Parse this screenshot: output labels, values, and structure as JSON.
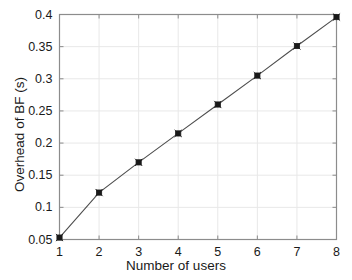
{
  "chart_data": {
    "type": "line",
    "title": "",
    "xlabel": "Number of users",
    "ylabel": "Overhead of BF (s)",
    "x": [
      1,
      2,
      3,
      4,
      5,
      6,
      7,
      8
    ],
    "values": [
      0.053,
      0.123,
      0.17,
      0.215,
      0.26,
      0.305,
      0.351,
      0.396
    ],
    "series": [
      {
        "name": "Overhead of BF",
        "values": [
          0.053,
          0.123,
          0.17,
          0.215,
          0.26,
          0.305,
          0.351,
          0.396
        ]
      }
    ],
    "xlim": [
      1,
      8
    ],
    "ylim": [
      0.05,
      0.4
    ],
    "xticks": [
      1,
      2,
      3,
      4,
      5,
      6,
      7,
      8
    ],
    "yticks": [
      0.05,
      0.1,
      0.15,
      0.2,
      0.25,
      0.3,
      0.35,
      0.4
    ],
    "xtick_labels": [
      "1",
      "2",
      "3",
      "4",
      "5",
      "6",
      "7",
      "8"
    ],
    "ytick_labels": [
      "0.05",
      "0.1",
      "0.15",
      "0.2",
      "0.25",
      "0.3",
      "0.35",
      "0.4"
    ],
    "grid": true,
    "legend": false,
    "marker": "square",
    "line_color": "#4d4d4d",
    "marker_color": "#1a1a1a",
    "grid_color": "#e8e8e8",
    "axis_color": "#8c8c8c",
    "background_color": "#ffffff"
  }
}
